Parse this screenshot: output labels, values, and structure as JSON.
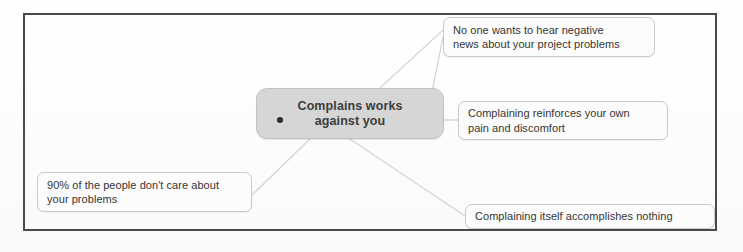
{
  "diagram": {
    "type": "mind-map",
    "frame": {
      "present": true,
      "border_color": "#4a4a4a"
    },
    "central_node": {
      "label": "Complains works against you",
      "line_1": "Complains works",
      "line_2": "against you",
      "fill_color": "#d6d6d6",
      "text_color": "#3c3c3c",
      "bullet": "●"
    },
    "branches": [
      {
        "id": "top-right",
        "label": "No one wants to hear negative news about your project problems",
        "line_1": "No one wants to hear negative",
        "line_2": "news about your project problems",
        "position": "top-right"
      },
      {
        "id": "mid-right",
        "label": "Complaining reinforces your own pain and discomfort",
        "line_1": "Complaining reinforces your own",
        "line_2": "pain and discomfort",
        "position": "middle-right"
      },
      {
        "id": "bottom-right",
        "label": "Complaining itself accomplishes nothing",
        "line_1": "Complaining itself accomplishes nothing",
        "line_2": "",
        "position": "bottom-right"
      },
      {
        "id": "bottom-left",
        "label": "90% of the people don't care about your problems",
        "line_1": "90% of the people don't care about",
        "line_2": "your problems",
        "position": "bottom-left"
      }
    ],
    "colors": {
      "node_fill": "#d6d6d6",
      "callout_fill": "#fcfcfc",
      "callout_border": "#c9c9c9",
      "connector": "#cfcfcf",
      "frame_border": "#4a4a4a",
      "text": "#353535"
    }
  }
}
